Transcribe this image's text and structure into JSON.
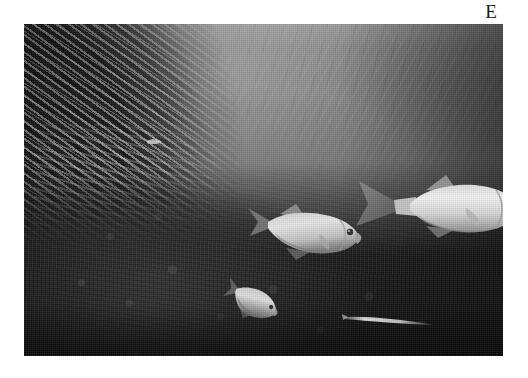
{
  "figure": {
    "panel_label": "E",
    "caption": "",
    "background_color": "#ffffff"
  },
  "photo": {
    "name": "underwater-reef-photograph",
    "description": "Black and white underwater photograph of a coral reef drop-off with a dense school of small baitfish on the left, three silvery trevally (jack) fish swimming in open water, and a long slender fish near the reef edge",
    "rendering": "grayscale",
    "frame": {
      "x": 24,
      "y": 24,
      "width": 479,
      "height": 332
    },
    "tones": {
      "water_highlight": "#9a9a9a",
      "water_mid": "#7c7c7c",
      "water_deep": "#4a4a4a",
      "reef_dark": "#1b1b1b",
      "fish_highlight": "#e8e8e8",
      "fish_shadow": "#6a6a6a"
    },
    "regions": [
      {
        "name": "water-surface",
        "label": "sunlit water surface",
        "position": "top"
      },
      {
        "name": "open-water",
        "label": "open blue water column",
        "position": "center-right"
      },
      {
        "name": "baitfish-school",
        "label": "dense school of baitfish",
        "position": "left"
      },
      {
        "name": "coral-reef",
        "label": "dark coral reef substrate",
        "position": "bottom"
      }
    ],
    "subjects": [
      {
        "name": "trevally-large",
        "label": "large trevally",
        "facing": "right",
        "cx": 424,
        "cy": 183
      },
      {
        "name": "trevally-middle",
        "label": "middle trevally",
        "facing": "right",
        "cx": 285,
        "cy": 210
      },
      {
        "name": "trevally-small",
        "label": "small trevally",
        "facing": "lower-right",
        "cx": 228,
        "cy": 285
      },
      {
        "name": "needlefish",
        "label": "slender needlefish",
        "facing": "left",
        "cx": 365,
        "cy": 297
      },
      {
        "name": "stray-baitfish",
        "label": "stray baitfish",
        "facing": "right",
        "cx": 128,
        "cy": 118
      }
    ]
  }
}
